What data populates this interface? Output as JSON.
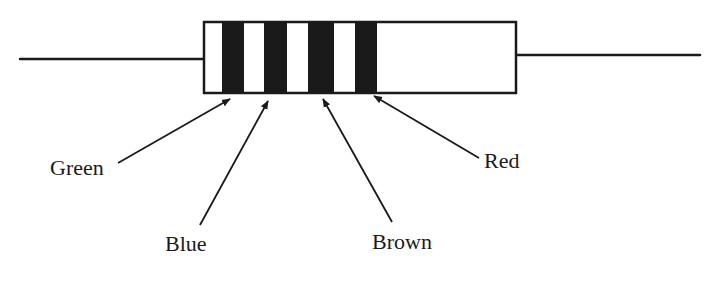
{
  "diagram": {
    "title": "",
    "colors": {
      "ink": "#1a1a1a",
      "background": "#ffffff"
    },
    "resistor": {
      "body": {
        "x": 204,
        "y": 22,
        "width": 312,
        "height": 71
      },
      "left_lead": {
        "x1": 20,
        "y1": 59,
        "x2": 204,
        "y2": 59
      },
      "right_lead": {
        "x1": 516,
        "y1": 55,
        "x2": 700,
        "y2": 55
      },
      "bands": [
        {
          "name": "band-1",
          "color_label": "Green",
          "x": 222,
          "width": 22
        },
        {
          "name": "band-2",
          "color_label": "Blue",
          "x": 264,
          "width": 23
        },
        {
          "name": "band-3",
          "color_label": "Brown",
          "x": 308,
          "width": 26
        },
        {
          "name": "band-4",
          "color_label": "Red",
          "x": 355,
          "width": 22
        }
      ]
    },
    "labels": [
      {
        "text": "Green",
        "x": 50,
        "y": 157,
        "arrow": {
          "x1": 118,
          "y1": 163,
          "x2": 230,
          "y2": 99
        }
      },
      {
        "text": "Blue",
        "x": 165,
        "y": 233,
        "arrow": {
          "x1": 200,
          "y1": 225,
          "x2": 268,
          "y2": 101
        }
      },
      {
        "text": "Brown",
        "x": 372,
        "y": 231,
        "arrow": {
          "x1": 392,
          "y1": 222,
          "x2": 323,
          "y2": 99
        }
      },
      {
        "text": "Red",
        "x": 484,
        "y": 150,
        "arrow": {
          "x1": 479,
          "y1": 158,
          "x2": 374,
          "y2": 96
        }
      }
    ]
  }
}
